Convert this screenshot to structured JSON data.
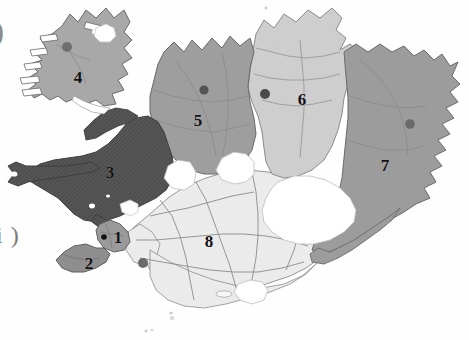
{
  "figure": {
    "background_color": "#fefefe",
    "width": 469,
    "height": 340
  },
  "captions": {
    "top_left_fragment": ")",
    "bottom_left_fragment": "i )"
  },
  "palette": {
    "region_1": "#9a9a9a",
    "region_2": "#8e8e8e",
    "region_3": "#565656",
    "region_4": "#a8a8a8",
    "region_5": "#9e9e9e",
    "region_6": "#cecece",
    "region_7": "#9c9c9c",
    "region_8": "#ebebeb",
    "glacier": "#ffffff",
    "outline": "#6a6a6a",
    "subdivision_line": "#8b8b8b",
    "marker": "#4a4a4a",
    "capital_marker": "#111111",
    "label_text": "#111111"
  },
  "regions": [
    {
      "id": 1,
      "label": "1",
      "fill": "#9a9a9a",
      "label_x": 118,
      "label_y": 237
    },
    {
      "id": 2,
      "label": "2",
      "fill": "#8e8e8e",
      "label_x": 89,
      "label_y": 263
    },
    {
      "id": 3,
      "label": "3",
      "fill": "#565656",
      "label_x": 110,
      "label_y": 172
    },
    {
      "id": 4,
      "label": "4",
      "fill": "#a8a8a8",
      "label_x": 78,
      "label_y": 77
    },
    {
      "id": 5,
      "label": "5",
      "fill": "#9e9e9e",
      "label_x": 198,
      "label_y": 120
    },
    {
      "id": 6,
      "label": "6",
      "fill": "#cecece",
      "label_x": 302,
      "label_y": 99
    },
    {
      "id": 7,
      "label": "7",
      "fill": "#9c9c9c",
      "label_x": 385,
      "label_y": 165
    },
    {
      "id": 8,
      "label": "8",
      "fill": "#ebebeb",
      "label_x": 209,
      "label_y": 241
    }
  ],
  "markers": [
    {
      "name": "marker-region-4",
      "x": 67,
      "y": 47,
      "r": 5.0,
      "fill": "#6f6f6f"
    },
    {
      "name": "marker-region-5",
      "x": 204,
      "y": 90,
      "r": 4.6,
      "fill": "#555555"
    },
    {
      "name": "marker-region-6",
      "x": 265,
      "y": 94,
      "r": 5.0,
      "fill": "#4a4a4a"
    },
    {
      "name": "marker-region-7",
      "x": 410,
      "y": 124,
      "r": 4.8,
      "fill": "#6a6a6a"
    },
    {
      "name": "marker-capital-region-1",
      "x": 104,
      "y": 237,
      "r": 2.8,
      "fill": "#111111"
    },
    {
      "name": "marker-region-8",
      "x": 143,
      "y": 263,
      "r": 5.0,
      "fill": "#6a6a6a"
    }
  ],
  "glaciers": [
    {
      "name": "glacier-vatnajokull"
    },
    {
      "name": "glacier-hofsjokull"
    },
    {
      "name": "glacier-langjokull"
    },
    {
      "name": "glacier-myrdalsjokull"
    },
    {
      "name": "glacier-drangajokull"
    }
  ]
}
